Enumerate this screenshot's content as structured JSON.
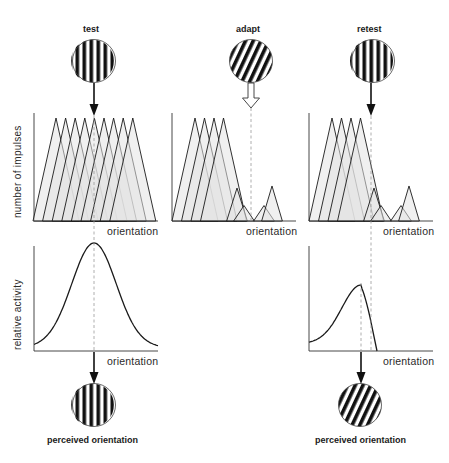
{
  "columns": {
    "test": {
      "title": "test",
      "grating": "vertical"
    },
    "adapt": {
      "title": "adapt",
      "grating": "tilted"
    },
    "retest": {
      "title": "retest",
      "grating": "vertical"
    }
  },
  "top_panels": {
    "ylabel": "number of impulses",
    "xlabel": "orientation"
  },
  "bottom_panels": {
    "ylabel": "relative activity",
    "xlabel": "orientation"
  },
  "outputs": {
    "test": {
      "label": "perceived orientation",
      "grating": "vertical"
    },
    "retest": {
      "label": "perceived orientation",
      "grating": "tilted"
    }
  },
  "colors": {
    "ink": "#1a1a1a",
    "fill": "#e4e4e4",
    "dash": "#9a9a9a"
  },
  "chart_data": [
    {
      "type": "area",
      "title": "test — population response",
      "xlabel": "orientation",
      "ylabel": "number of impulses",
      "description": "9 overlapping triangular tuning curves of equal height, centered around the test orientation",
      "peaks": [
        1,
        1,
        1,
        1,
        1,
        1,
        1,
        1,
        1
      ]
    },
    {
      "type": "area",
      "title": "adapt — population response",
      "xlabel": "orientation",
      "ylabel": "number of impulses",
      "description": "tuning curves near adapted orientation reduced in amplitude",
      "peaks": [
        1,
        1,
        1,
        1,
        0.32,
        0.15,
        0.15,
        0.34
      ]
    },
    {
      "type": "area",
      "title": "retest — population response",
      "xlabel": "orientation",
      "ylabel": "number of impulses",
      "peaks": [
        1,
        1,
        1,
        1,
        0.32,
        0.15,
        0.15,
        0.34
      ]
    },
    {
      "type": "line",
      "title": "test — relative activity",
      "xlabel": "orientation",
      "ylabel": "relative activity",
      "description": "symmetric bell curve peaking at test orientation"
    },
    {
      "type": "line",
      "title": "retest — relative activity",
      "xlabel": "orientation",
      "ylabel": "relative activity",
      "description": "skewed curve, peak shifted away from adapted orientation, lower amplitude (~0.55 of test peak)"
    }
  ]
}
